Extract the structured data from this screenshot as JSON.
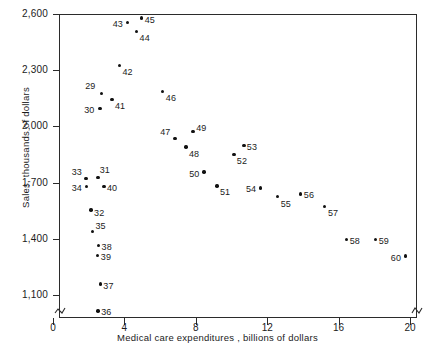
{
  "chart_data": {
    "type": "scatter",
    "title": "",
    "xlabel": "Medical care expenditures , billions of dollars",
    "ylabel": "Sales, thousands of dollars",
    "xlim": [
      0,
      20.6
    ],
    "ylim": [
      1050,
      2600
    ],
    "xticks": [
      0,
      4,
      8,
      12,
      16,
      20
    ],
    "xtick_labels": [
      "0",
      "4",
      "8",
      "12",
      "16",
      "20"
    ],
    "yticks": [
      1100,
      1400,
      1700,
      2000,
      2300,
      2600
    ],
    "ytick_labels": [
      "1,100",
      "1,400",
      "1,700",
      "2,000",
      "2,300",
      "2,600"
    ],
    "grid": false,
    "legend": null,
    "axis_break_x": true,
    "axis_break_y": true,
    "point_label_kind": "year-index",
    "points": [
      {
        "label": "29",
        "x": 2.7,
        "y": 2175,
        "lx": 2.38,
        "ly": 2215,
        "pos": "l"
      },
      {
        "label": "30",
        "x": 2.64,
        "y": 2097,
        "lx": 2.32,
        "ly": 2090,
        "pos": "l"
      },
      {
        "label": "31",
        "x": 2.52,
        "y": 1726,
        "lx": 2.62,
        "ly": 1766,
        "pos": "r"
      },
      {
        "label": "32",
        "x": 2.13,
        "y": 1554,
        "lx": 2.3,
        "ly": 1540,
        "pos": "r"
      },
      {
        "label": "33",
        "x": 1.85,
        "y": 1721,
        "lx": 1.62,
        "ly": 1757,
        "pos": "l"
      },
      {
        "label": "34",
        "x": 1.87,
        "y": 1679,
        "lx": 1.62,
        "ly": 1672,
        "pos": "l"
      },
      {
        "label": "35",
        "x": 2.21,
        "y": 1438,
        "lx": 2.38,
        "ly": 1470,
        "pos": "r"
      },
      {
        "label": "36",
        "x": 2.52,
        "y": 1015,
        "lx": 2.7,
        "ly": 1008,
        "pos": "r"
      },
      {
        "label": "37",
        "x": 2.65,
        "y": 1158,
        "lx": 2.82,
        "ly": 1150,
        "pos": "r"
      },
      {
        "label": "38",
        "x": 2.55,
        "y": 1365,
        "lx": 2.72,
        "ly": 1358,
        "pos": "r"
      },
      {
        "label": "39",
        "x": 2.5,
        "y": 1312,
        "lx": 2.68,
        "ly": 1305,
        "pos": "r"
      },
      {
        "label": "40",
        "x": 2.85,
        "y": 1680,
        "lx": 3.02,
        "ly": 1672,
        "pos": "r"
      },
      {
        "label": "41",
        "x": 3.3,
        "y": 2144,
        "lx": 3.47,
        "ly": 2108,
        "pos": "r"
      },
      {
        "label": "42",
        "x": 3.72,
        "y": 2325,
        "lx": 3.89,
        "ly": 2290,
        "pos": "r"
      },
      {
        "label": "43",
        "x": 4.16,
        "y": 2554,
        "lx": 3.92,
        "ly": 2545,
        "pos": "l"
      },
      {
        "label": "44",
        "x": 4.67,
        "y": 2508,
        "lx": 4.85,
        "ly": 2470,
        "pos": "r"
      },
      {
        "label": "45",
        "x": 4.96,
        "y": 2578,
        "lx": 5.14,
        "ly": 2570,
        "pos": "r"
      },
      {
        "label": "46",
        "x": 6.13,
        "y": 2185,
        "lx": 6.32,
        "ly": 2150,
        "pos": "r"
      },
      {
        "label": "47",
        "x": 6.84,
        "y": 1935,
        "lx": 6.58,
        "ly": 1970,
        "pos": "l"
      },
      {
        "label": "48",
        "x": 7.45,
        "y": 1890,
        "lx": 7.62,
        "ly": 1855,
        "pos": "r"
      },
      {
        "label": "49",
        "x": 7.85,
        "y": 1974,
        "lx": 8.02,
        "ly": 1990,
        "pos": "r"
      },
      {
        "label": "50",
        "x": 8.45,
        "y": 1756,
        "lx": 8.2,
        "ly": 1748,
        "pos": "l"
      },
      {
        "label": "51",
        "x": 9.18,
        "y": 1682,
        "lx": 9.35,
        "ly": 1648,
        "pos": "r"
      },
      {
        "label": "52",
        "x": 10.13,
        "y": 1850,
        "lx": 10.3,
        "ly": 1815,
        "pos": "r"
      },
      {
        "label": "53",
        "x": 10.69,
        "y": 1898,
        "lx": 10.86,
        "ly": 1890,
        "pos": "r"
      },
      {
        "label": "54",
        "x": 11.64,
        "y": 1672,
        "lx": 11.38,
        "ly": 1664,
        "pos": "l"
      },
      {
        "label": "55",
        "x": 12.59,
        "y": 1625,
        "lx": 12.76,
        "ly": 1588,
        "pos": "r"
      },
      {
        "label": "56",
        "x": 13.88,
        "y": 1640,
        "lx": 14.05,
        "ly": 1632,
        "pos": "r"
      },
      {
        "label": "57",
        "x": 15.22,
        "y": 1573,
        "lx": 15.4,
        "ly": 1538,
        "pos": "r"
      },
      {
        "label": "58",
        "x": 16.45,
        "y": 1395,
        "lx": 16.62,
        "ly": 1388,
        "pos": "r"
      },
      {
        "label": "59",
        "x": 18.08,
        "y": 1396,
        "lx": 18.25,
        "ly": 1388,
        "pos": "r"
      },
      {
        "label": "60",
        "x": 19.74,
        "y": 1308,
        "lx": 19.5,
        "ly": 1300,
        "pos": "l"
      }
    ]
  }
}
